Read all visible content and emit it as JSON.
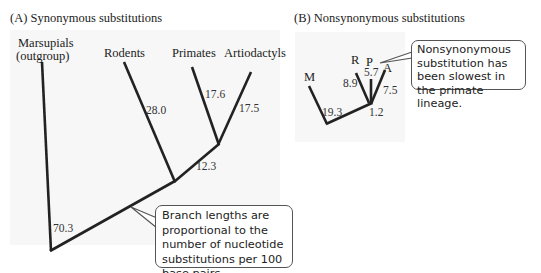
{
  "panel_a": {
    "title": "(A)  Synonymous substitutions",
    "taxa": {
      "marsupials_line1": "Marsupials",
      "marsupials_line2": "(outgroup)",
      "rodents": "Rodents",
      "primates": "Primates",
      "artiodactyls": "Artiodactyls"
    },
    "branch_lengths": {
      "marsupials": "70.3",
      "rodents": "28.0",
      "primates": "17.6",
      "artiodactyls": "17.5",
      "internal": "12.3"
    },
    "callout": "Branch lengths are proportional to the number of nucleotide substitutions per 100 base pairs."
  },
  "panel_b": {
    "title": "(B)  Nonsynonymous substitutions",
    "taxa": {
      "m": "M",
      "r": "R",
      "p": "P",
      "a": "A"
    },
    "branch_lengths": {
      "m": "19.3",
      "r": "8.9",
      "p": "5.7",
      "a": "7.5",
      "internal": "1.2"
    },
    "callout": "Nonsynonymous substitution has been slowest in the primate lineage."
  }
}
